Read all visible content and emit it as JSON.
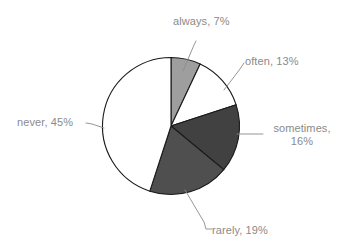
{
  "chart_data": {
    "type": "pie",
    "title": "",
    "subtitle": "",
    "xlabel": "",
    "ylabel": "",
    "legend_position": "none",
    "grid": false,
    "units": "percent",
    "total": 100,
    "start_angle_deg": 0,
    "direction": "clockwise",
    "categories": [
      "always",
      "often",
      "sometimes",
      "rarely",
      "never"
    ],
    "values": [
      7,
      13,
      16,
      19,
      45
    ],
    "labels": [
      "always, 7%",
      "often, 13%",
      "sometimes, 16%",
      "rarely, 19%",
      "never, 45%"
    ],
    "slices": [
      {
        "name": "always",
        "value": 7,
        "label": "always, 7%",
        "color": "#9e9e9e"
      },
      {
        "name": "often",
        "value": 13,
        "label": "often, 13%",
        "color": "#ffffff"
      },
      {
        "name": "sometimes",
        "value": 16,
        "label": "sometimes, 16%",
        "color": "#414141"
      },
      {
        "name": "rarely",
        "value": 19,
        "label": "rarely, 19%",
        "color": "#4f4f4f"
      },
      {
        "name": "never",
        "value": 45,
        "label": "never, 45%",
        "color": "#ffffff"
      }
    ],
    "label_lines": {
      "sometimes_line_1": "sometimes,",
      "sometimes_line_2": "16%"
    },
    "colors": {
      "outline": "#1a1a1a",
      "label_text": "#8a8a8a",
      "leader_line": "#8b8b8b",
      "background": "#ffffff"
    }
  }
}
